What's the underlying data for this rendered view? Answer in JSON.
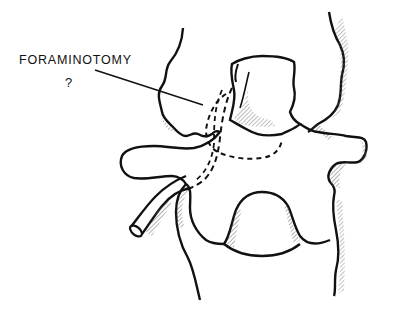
{
  "figure": {
    "annotation": {
      "label": "FORAMINOTOMY",
      "suffix": "?"
    },
    "colors": {
      "line": "#111111",
      "background": "#ffffff",
      "hatch": "#555555"
    },
    "structures": [
      "superior-articular-process-left",
      "superior-articular-process-right",
      "facet-joint",
      "transverse-process-left",
      "transverse-process-right",
      "vertebral-body-outline",
      "spinal-canal-foramen",
      "nerve-root",
      "foraminotomy-dashed-outline",
      "annotation-leader-line"
    ]
  }
}
